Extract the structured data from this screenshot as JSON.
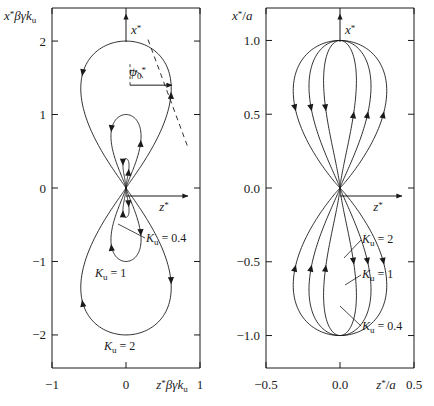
{
  "figure": {
    "background_color": "#ffffff",
    "line_color": "#1a1a1a",
    "panels": [
      {
        "id": "left",
        "name": "unnormalized-trajectory-panel",
        "y_axis_label": "x*βγk",
        "y_axis_label_sub": "u",
        "x_axis_label": "z*βγk",
        "x_axis_label_sub": "u",
        "x_ticks": [
          "−1",
          "0",
          "1"
        ],
        "x_tick_values": [
          -1,
          0,
          1
        ],
        "y_ticks": [
          "2",
          "1",
          "0",
          "−1",
          "−2"
        ],
        "y_tick_values": [
          2,
          1,
          0,
          -1,
          -2
        ],
        "xlim": [
          -1,
          1
        ],
        "ylim": [
          -2.45,
          2.45
        ],
        "axis_arrow_vertical": "x*",
        "axis_arrow_horizontal": "z*",
        "angle_annotation": "ψ",
        "angle_annotation_sub": "0",
        "angle_annotation_sup": "*",
        "curve_labels": [
          {
            "text": "K",
            "sub": "u",
            "eq": "= 0.4"
          },
          {
            "text": "K",
            "sub": "u",
            "eq": "= 1"
          },
          {
            "text": "K",
            "sub": "u",
            "eq": "= 2"
          }
        ]
      },
      {
        "id": "right",
        "name": "normalized-trajectory-panel",
        "y_axis_label": "x*/a",
        "x_axis_label": "z*/a",
        "x_ticks": [
          "−0.5",
          "0.0",
          "0.5"
        ],
        "x_tick_values": [
          -0.5,
          0.0,
          0.5
        ],
        "y_ticks": [
          "1.0",
          "0.5",
          "0.0",
          "−0.5",
          "−1.0"
        ],
        "y_tick_values": [
          1.0,
          0.5,
          0.0,
          -0.5,
          -1.0
        ],
        "xlim": [
          -0.5,
          0.5
        ],
        "ylim": [
          -1.22,
          1.22
        ],
        "axis_arrow_vertical": "x*",
        "axis_arrow_horizontal": "z*",
        "curve_labels": [
          {
            "text": "K",
            "sub": "u",
            "eq": "= 2"
          },
          {
            "text": "K",
            "sub": "u",
            "eq": "= 1"
          },
          {
            "text": "K",
            "sub": "u",
            "eq": "= 0.4"
          }
        ]
      }
    ]
  },
  "chart_data": {
    "type": "line",
    "title": "",
    "panels": [
      {
        "id": "left",
        "xlabel": "z*βγk_u",
        "ylabel": "x*βγk_u",
        "xlim": [
          -1,
          1
        ],
        "ylim": [
          -2.45,
          2.45
        ],
        "xticks": [
          -1,
          0,
          1
        ],
        "yticks": [
          2,
          1,
          0,
          -1,
          -2
        ],
        "grid": false,
        "legend": "inline-annotations",
        "annotations": [
          "ψ₀*",
          "x*",
          "z*"
        ],
        "series": [
          {
            "name": "K_u = 0.4",
            "K_u": 0.4,
            "amplitude_x": 0.4,
            "half_width_z": 0.04,
            "direction_arrows": 4
          },
          {
            "name": "K_u = 1",
            "K_u": 1.0,
            "amplitude_x": 1.0,
            "half_width_z": 0.175,
            "direction_arrows": 4
          },
          {
            "name": "K_u = 2",
            "K_u": 2.0,
            "amplitude_x": 2.0,
            "half_width_z": 0.5,
            "direction_arrows": 4
          }
        ]
      },
      {
        "id": "right",
        "xlabel": "z*/a",
        "ylabel": "x*/a",
        "xlim": [
          -0.5,
          0.5
        ],
        "ylim": [
          -1.22,
          1.22
        ],
        "xticks": [
          -0.5,
          0.0,
          0.5
        ],
        "yticks": [
          1.0,
          0.5,
          0.0,
          -0.5,
          -1.0
        ],
        "grid": false,
        "legend": "inline-annotations",
        "annotations": [
          "x*",
          "z*"
        ],
        "series": [
          {
            "name": "K_u = 2",
            "K_u": 2.0,
            "amplitude_x": 1.0,
            "half_width_z": 0.25,
            "direction_arrows": 6
          },
          {
            "name": "K_u = 1",
            "K_u": 1.0,
            "amplitude_x": 1.0,
            "half_width_z": 0.175,
            "direction_arrows": 6
          },
          {
            "name": "K_u = 0.4",
            "K_u": 0.4,
            "amplitude_x": 1.0,
            "half_width_z": 0.1,
            "direction_arrows": 6
          }
        ]
      }
    ]
  }
}
